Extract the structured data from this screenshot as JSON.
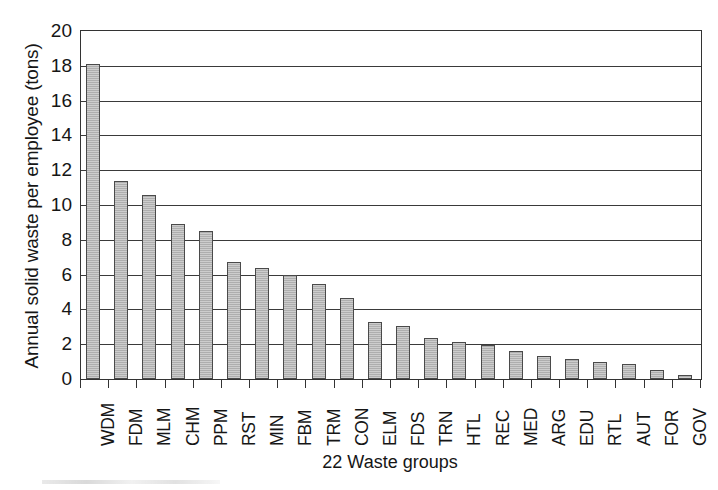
{
  "chart_data": {
    "type": "bar",
    "title": "",
    "xlabel": "22 Waste groups",
    "ylabel": "Annual solid waste per employee (tons)",
    "ylim": [
      0,
      20
    ],
    "ytick_step": 2,
    "yticks": [
      0,
      2,
      4,
      6,
      8,
      10,
      12,
      14,
      16,
      18,
      20
    ],
    "ytick_labels": [
      "0",
      "2",
      "4",
      "6",
      "8",
      "10",
      "12",
      "14",
      "16",
      "18",
      "20"
    ],
    "grid": "horizontal",
    "legend": "none",
    "bar_color": "#b5b5b5",
    "bar_edge_color": "#4a4a4a",
    "axis_color": "#333333",
    "categories": [
      "WDM",
      "FDM",
      "MLM",
      "CHM",
      "PPM",
      "RST",
      "MIN",
      "FBM",
      "TRM",
      "CON",
      "ELM",
      "FDS",
      "TRN",
      "HTL",
      "REC",
      "MED",
      "ARG",
      "EDU",
      "RTL",
      "AUT",
      "FOR",
      "GOV"
    ],
    "values": [
      18.1,
      11.4,
      10.6,
      8.9,
      8.5,
      6.7,
      6.4,
      6.0,
      5.45,
      4.65,
      3.3,
      3.05,
      2.35,
      2.15,
      1.95,
      1.6,
      1.35,
      1.15,
      0.95,
      0.85,
      0.5,
      0.25
    ]
  }
}
